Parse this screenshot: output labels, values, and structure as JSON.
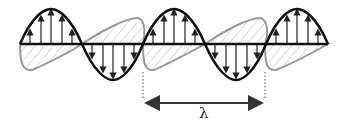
{
  "diagram": {
    "electric_field": {
      "color": "#111111",
      "start_x": 20,
      "period_px": 123,
      "axis_y": 44,
      "amplitude_px": 35,
      "cycles": 2.5
    },
    "magnetic_field": {
      "color": "#9a9a9a",
      "hatch_color": "#b5b5b5"
    },
    "wavelength": {
      "label": "λ",
      "from_x": 143,
      "to_x": 265,
      "arrow_y": 103,
      "color": "#333333"
    }
  }
}
